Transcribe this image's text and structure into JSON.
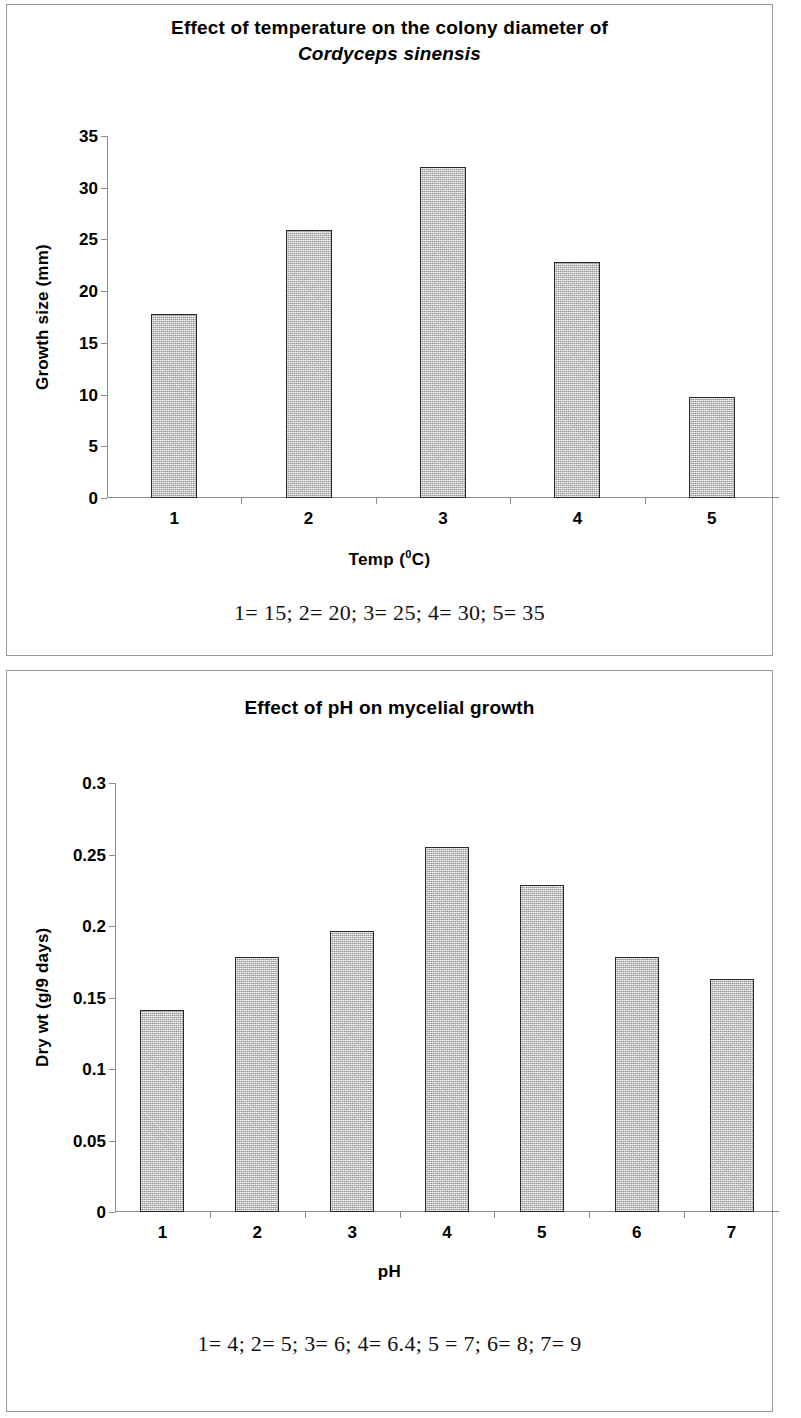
{
  "page": {
    "background": "#ffffff",
    "panel_border_color": "#9a9a9a",
    "bar_fill": "#c2c2c2",
    "bar_border": "#2a2a2a",
    "axis_color": "#8c8c8c"
  },
  "figure_top": {
    "title_line1": "Effect of temperature on the colony diameter of",
    "title_line2": "Cordyceps sinensis",
    "caption": "1= 15; 2= 20; 3= 25; 4= 30; 5= 35"
  },
  "figure_bottom": {
    "title_line1": "Effect of pH on mycelial growth",
    "caption": "1= 4; 2= 5; 3= 6; 4= 6.4; 5 = 7; 6= 8; 7= 9"
  },
  "chart_data": [
    {
      "type": "bar",
      "title": "Effect of temperature on the colony diameter of Cordyceps sinensis",
      "xlabel": "Temp (0C)",
      "xlabel_base": "Temp (",
      "xlabel_sup": "0",
      "xlabel_tail": "C)",
      "ylabel": "Growth size (mm)",
      "categories": [
        "1",
        "2",
        "3",
        "4",
        "5"
      ],
      "category_meanings": [
        "15",
        "20",
        "25",
        "30",
        "35"
      ],
      "values": [
        17.8,
        25.9,
        32.0,
        22.8,
        9.8
      ],
      "ylim": [
        0,
        35
      ],
      "yticks": [
        0,
        5,
        10,
        15,
        20,
        25,
        30,
        35
      ],
      "ytick_labels": [
        "0",
        "5",
        "10",
        "15",
        "20",
        "25",
        "30",
        "35"
      ],
      "grid": false,
      "legend": "none"
    },
    {
      "type": "bar",
      "title": "Effect of pH on mycelial growth",
      "xlabel": "pH",
      "ylabel": "Dry wt (g/9 days)",
      "categories": [
        "1",
        "2",
        "3",
        "4",
        "5",
        "6",
        "7"
      ],
      "category_meanings": [
        "4",
        "5",
        "6",
        "6.4",
        "7",
        "8",
        "9"
      ],
      "values": [
        0.1415,
        0.1785,
        0.1965,
        0.255,
        0.229,
        0.178,
        0.163
      ],
      "ylim": [
        0,
        0.3
      ],
      "yticks": [
        0,
        0.05,
        0.1,
        0.15,
        0.2,
        0.25,
        0.3
      ],
      "ytick_labels": [
        "0",
        "0.05",
        "0.1",
        "0.15",
        "0.2",
        "0.25",
        "0.3"
      ],
      "grid": false,
      "legend": "none"
    }
  ]
}
